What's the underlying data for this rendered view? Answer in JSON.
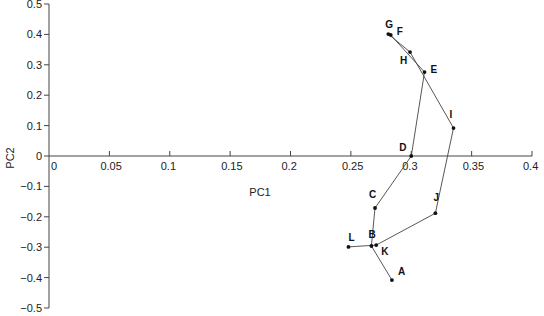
{
  "chart_data": {
    "type": "scatter",
    "title": "",
    "xlabel": "PC1",
    "ylabel": "PC2",
    "xlim": [
      0,
      0.4
    ],
    "ylim": [
      -0.5,
      0.5
    ],
    "grid": false,
    "legend": null,
    "connected": true,
    "x_ticks": [
      "0",
      "0.05",
      "0.1",
      "0.15",
      "0.2",
      "0.25",
      "0.3",
      "0.35",
      "0.4"
    ],
    "y_ticks": [
      "0.5",
      "0.4",
      "0.3",
      "0.2",
      "0.1",
      "0",
      "−0.1",
      "−0.2",
      "−0.3",
      "−0.4",
      "−0.5"
    ],
    "points": [
      {
        "label": "A",
        "x": 0.284,
        "y": -0.408
      },
      {
        "label": "B",
        "x": 0.267,
        "y": -0.296
      },
      {
        "label": "C",
        "x": 0.27,
        "y": -0.171
      },
      {
        "label": "D",
        "x": 0.3,
        "y": 0.0
      },
      {
        "label": "E",
        "x": 0.311,
        "y": 0.276
      },
      {
        "label": "F",
        "x": 0.283,
        "y": 0.398
      },
      {
        "label": "G",
        "x": 0.281,
        "y": 0.401
      },
      {
        "label": "H",
        "x": 0.299,
        "y": 0.342
      },
      {
        "label": "I",
        "x": 0.335,
        "y": 0.092
      },
      {
        "label": "J",
        "x": 0.32,
        "y": -0.188
      },
      {
        "label": "K",
        "x": 0.271,
        "y": -0.293
      },
      {
        "label": "L",
        "x": 0.248,
        "y": -0.299
      }
    ],
    "label_offsets": {
      "A": [
        6,
        -5
      ],
      "B": [
        -3,
        -8
      ],
      "C": [
        -6,
        -10
      ],
      "D": [
        -12,
        -5
      ],
      "E": [
        6,
        1
      ],
      "F": [
        6,
        0
      ],
      "G": [
        -3,
        -6
      ],
      "H": [
        -10,
        12
      ],
      "I": [
        -4,
        -10
      ],
      "J": [
        -2,
        -12
      ],
      "K": [
        5,
        10
      ],
      "L": [
        0,
        -6
      ]
    }
  }
}
